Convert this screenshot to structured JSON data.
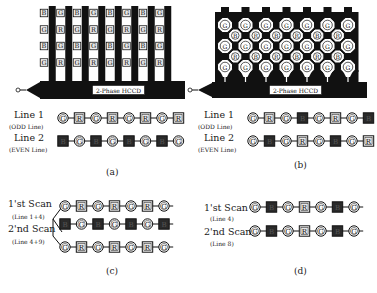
{
  "figure": {
    "panels": {
      "a": {
        "caption": "(a)",
        "hccd_label": "2-Phase HCCD",
        "grid": [
          [
            "B",
            "G",
            "B",
            "G",
            "B",
            "G",
            "B",
            "G"
          ],
          [
            "G",
            "R",
            "G",
            "R",
            "G",
            "R",
            "G",
            "R"
          ],
          [
            "B",
            "G",
            "B",
            "G",
            "B",
            "G",
            "B",
            "G"
          ],
          [
            "G",
            "R",
            "G",
            "R",
            "G",
            "R",
            "G",
            "R"
          ]
        ],
        "line1": {
          "label": "Line 1",
          "sub": "(ODD Line)",
          "seq": [
            "G",
            "R",
            "G",
            "R",
            "G",
            "R",
            "G",
            "R"
          ]
        },
        "line2": {
          "label": "Line 2",
          "sub": "(EVEN Line)",
          "seq": [
            "B",
            "G",
            "B",
            "G",
            "B",
            "G",
            "B",
            "G"
          ]
        }
      },
      "b": {
        "caption": "(b)",
        "hccd_label": "2-Phase HCCD",
        "rows_g": [
          [
            "G",
            "G",
            "G",
            "G",
            "G",
            "G",
            "G"
          ],
          [
            "G",
            "G",
            "G",
            "G",
            "G",
            "G",
            "G"
          ],
          [
            "G",
            "G",
            "G",
            "G",
            "G",
            "G",
            "G"
          ]
        ],
        "rows_mid": [
          [
            "B",
            "R",
            "B",
            "R",
            "B",
            "R"
          ],
          [
            "R",
            "B",
            "R",
            "B",
            "R",
            "B"
          ]
        ],
        "line1": {
          "label": "Line 1",
          "sub": "(ODD Line)",
          "seq": [
            "G",
            "R",
            "G",
            "B",
            "G",
            "R",
            "G",
            "B"
          ]
        },
        "line2": {
          "label": "Line 2",
          "sub": "(EVEN Line)",
          "seq": [
            "G",
            "B",
            "G",
            "R",
            "G",
            "B",
            "G",
            "R"
          ]
        }
      },
      "c": {
        "caption": "(c)",
        "scan1": {
          "label": "1'st Scan",
          "sub": "(Line 1+4)"
        },
        "scan2": {
          "label": "2'nd Scan",
          "sub": "(Line 4+9)"
        },
        "row1": [
          "G",
          "R",
          "G",
          "R",
          "G",
          "R",
          "G"
        ],
        "row2": [
          "B",
          "G",
          "B",
          "G",
          "B",
          "G",
          "B"
        ],
        "row3": [
          "G",
          "R",
          "G",
          "R",
          "G",
          "R",
          "G"
        ]
      },
      "d": {
        "caption": "(d)",
        "scan1": {
          "label": "1'st Scan",
          "sub": "(Line 4)",
          "seq": [
            "G",
            "B",
            "G",
            "R",
            "G",
            "B",
            "G"
          ]
        },
        "scan2": {
          "label": "2'nd Scan",
          "sub": "(Line 8)",
          "seq": [
            "G",
            "B",
            "G",
            "R",
            "G",
            "B",
            "G"
          ]
        }
      }
    },
    "colors": {
      "ink": "#111111",
      "dark_fill": "#2a2a2a",
      "light_box": "#e6e6e6",
      "background": "#ffffff"
    }
  }
}
